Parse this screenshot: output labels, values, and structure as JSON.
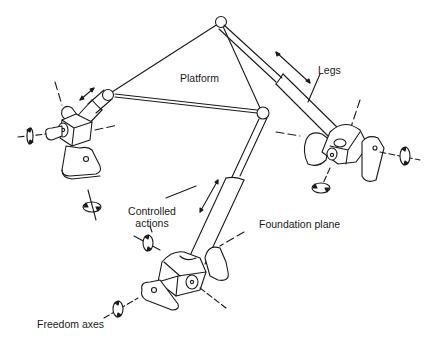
{
  "diagram": {
    "type": "mechanism-schematic",
    "labels": {
      "platform": "Platform",
      "legs": "Legs",
      "controlled_actions_line1": "Controlled",
      "controlled_actions_line2": "actions",
      "foundation_plane": "Foundation plane",
      "freedom_axes": "Freedom axes"
    },
    "nodes": [
      {
        "id": "platform-top",
        "label": "",
        "x": 221,
        "y": 22
      },
      {
        "id": "platform-left",
        "label": "",
        "x": 108,
        "y": 95
      },
      {
        "id": "platform-right",
        "label": "",
        "x": 262,
        "y": 113
      },
      {
        "id": "base-left",
        "label": "",
        "x": 72,
        "y": 140
      },
      {
        "id": "base-right",
        "label": "",
        "x": 348,
        "y": 150
      },
      {
        "id": "base-bottom",
        "label": "",
        "x": 185,
        "y": 275
      }
    ],
    "edges": [
      {
        "from": "platform-top",
        "to": "platform-left",
        "kind": "platform-edge"
      },
      {
        "from": "platform-top",
        "to": "platform-right",
        "kind": "platform-edge"
      },
      {
        "from": "platform-left",
        "to": "platform-right",
        "kind": "platform-edge"
      },
      {
        "from": "platform-left",
        "to": "base-left",
        "kind": "leg"
      },
      {
        "from": "platform-top",
        "to": "base-right",
        "kind": "leg"
      },
      {
        "from": "platform-right",
        "to": "base-bottom",
        "kind": "leg"
      }
    ],
    "line_color": "#1a1a1a",
    "background": "#ffffff"
  }
}
